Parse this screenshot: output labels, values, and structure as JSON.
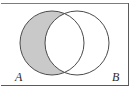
{
  "figure": {
    "name": "venn-diagram",
    "background_color": "#ffffff",
    "frame_color": "#5a5a5a"
  },
  "labels": {
    "set_a": "A",
    "set_b": "B"
  },
  "shading": {
    "fill_color": "#c9c9c9",
    "outline_color": "#4a4a4a",
    "shaded_region": "A-only",
    "intersection_filled": false
  },
  "chart_data": {
    "type": "diagram",
    "subtype": "venn2",
    "title": "",
    "sets": [
      {
        "label": "A",
        "center_x": 52,
        "center_y": 43,
        "radius": 32,
        "shaded": true,
        "fill": "#c9c9c9"
      },
      {
        "label": "B",
        "center_x": 77,
        "center_y": 43,
        "radius": 32,
        "shaded": false,
        "fill": "#ffffff"
      }
    ],
    "regions": [
      {
        "name": "A-only",
        "shaded": true,
        "fill": "#c9c9c9"
      },
      {
        "name": "A-and-B",
        "shaded": false,
        "fill": "#ffffff"
      },
      {
        "name": "B-only",
        "shaded": false,
        "fill": "#ffffff"
      },
      {
        "name": "outside",
        "shaded": false,
        "fill": "#ffffff"
      }
    ],
    "stroke_color": "#4a4a4a",
    "stroke_width": 1
  }
}
